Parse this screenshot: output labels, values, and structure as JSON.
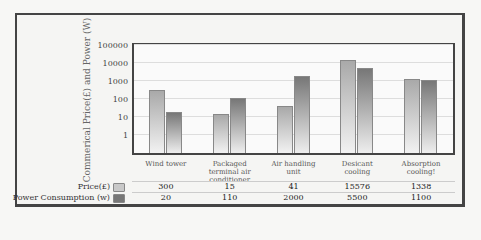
{
  "chart_data": {
    "type": "bar",
    "title": "",
    "xlabel": "",
    "ylabel": "Commerical Price(£) and Power (W)",
    "yscale": "log",
    "ylim": [
      0.1,
      100000
    ],
    "yticks": [
      "1",
      "10",
      "100",
      "1000",
      "10000",
      "100000"
    ],
    "grid": true,
    "legend_position": "table-left",
    "categories": [
      "Wind tower",
      "Packaged terminal air conditioner",
      "Air handling unit",
      "Desicant cooling",
      "Absorption cooling!"
    ],
    "series": [
      {
        "name": "Price(£)",
        "values": [
          300,
          15,
          41,
          15576,
          1338
        ],
        "color": "#b0b0b0"
      },
      {
        "name": "Power Consumption (w)",
        "values": [
          20,
          110,
          2000,
          5500,
          1100
        ],
        "color": "#777777"
      }
    ]
  },
  "table": {
    "rows": [
      {
        "label": "Price(£)",
        "values": [
          "300",
          "15",
          "41",
          "15576",
          "1338"
        ]
      },
      {
        "label": "Power Consumption (w)",
        "values": [
          "20",
          "110",
          "2000",
          "5500",
          "1100"
        ]
      }
    ]
  },
  "categories_display": [
    [
      "Wind tower"
    ],
    [
      "Packaged",
      "terminal air",
      "conditioner"
    ],
    [
      "Air handling",
      "unit"
    ],
    [
      "Desicant",
      "cooling"
    ],
    [
      "Absorption",
      "cooling!"
    ]
  ]
}
